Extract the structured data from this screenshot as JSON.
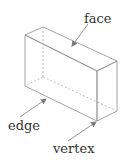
{
  "diagram": {
    "labels": {
      "face": "face",
      "edge": "edge",
      "vertex": "vertex"
    },
    "colors": {
      "line": "#9a9a9a",
      "hidden_line": "#b5b5b5",
      "arrow": "#7a7a7a",
      "text": "#333333"
    }
  }
}
